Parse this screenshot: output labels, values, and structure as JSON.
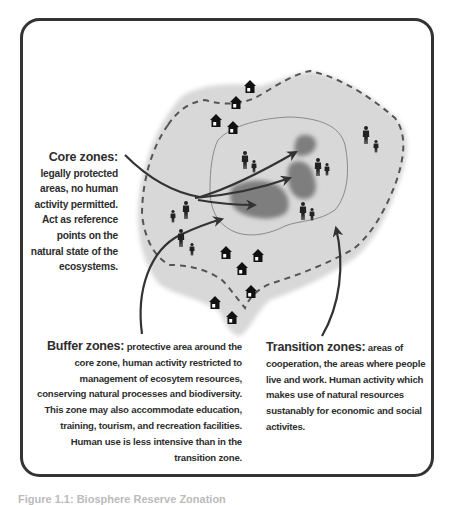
{
  "diagram": {
    "title": "Biosphere reserve zonation",
    "frame": {
      "stroke": "#333333",
      "fill": "#ffffff",
      "corner_radius": 18
    },
    "colors": {
      "transition_area": "#d9d9d9",
      "core_area": "#7f7f7f",
      "buffer_boundary_dashed": "#555555",
      "core_boundary_line": "#8a8a8a",
      "arrows": "#333333",
      "icons": "#111111"
    },
    "zones": {
      "core": {
        "heading": "Core zones:",
        "body": "legally protected areas, no human activity permitted. Act as reference points on the natural state of the ecosystems."
      },
      "buffer": {
        "heading": "Buffer zones:",
        "body": " protective area around the core zone, human activity restricted to management of ecosytem resources, conserving natural processes and biodiversity. This zone may also accommodate education, training, tourism, and recreation facilities. Human use is less intensive than in the transition zone."
      },
      "transition": {
        "heading": "Transition zones:",
        "body": " areas of cooperation, the areas where people live and work. Human activity which makes use of natural resources sustanably for economic and social activites."
      }
    },
    "icons": {
      "houses": 12,
      "people_groups": 6
    },
    "caption": "Figure 1.1: Biosphere Reserve Zonation"
  }
}
